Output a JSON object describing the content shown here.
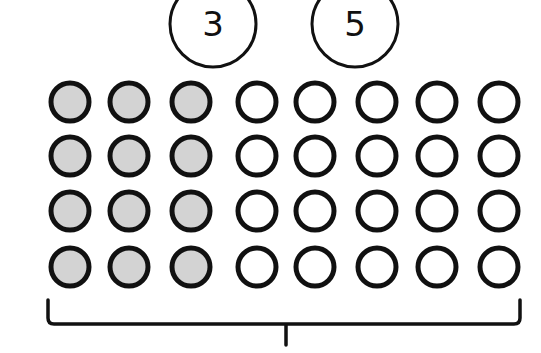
{
  "diagram": {
    "title_labels": [
      {
        "text": "3",
        "cx": 213,
        "cy": 24,
        "r": 43
      },
      {
        "text": "5",
        "cx": 355,
        "cy": 24,
        "r": 43
      }
    ],
    "grid": {
      "rows": 4,
      "cols": 8,
      "shaded_cols": 3,
      "unshaded_cols": 5,
      "col_x": [
        70,
        129,
        191,
        257,
        315,
        377,
        437,
        499
      ],
      "row_y": [
        102,
        156,
        211,
        267
      ],
      "radius": 19,
      "shaded_fill": "#d3d3d3",
      "unshaded_fill": "#ffffff",
      "stroke": "#111111"
    },
    "bracket": {
      "x_left": 48,
      "x_right": 520,
      "y_top": 300,
      "y_line": 324,
      "stem_x": 286,
      "stem_y_end": 345
    }
  }
}
